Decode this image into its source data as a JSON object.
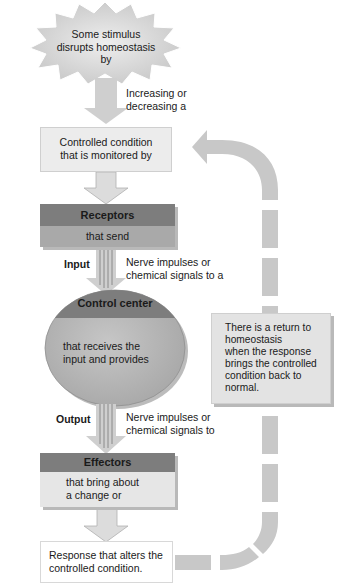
{
  "diagram": {
    "stimulus": {
      "text": "Some stimulus disrupts homeostasis by",
      "line1": "Some stimulus",
      "line2": "disrupts homeostasis by"
    },
    "stimulus_arrow_label": {
      "line1": "Increasing or",
      "line2": "decreasing a"
    },
    "controlled_condition": {
      "line1": "Controlled condition",
      "line2": "that is monitored by"
    },
    "receptors": {
      "title": "Receptors",
      "body": "that send"
    },
    "input": {
      "label": "Input",
      "line1": "Nerve impulses or",
      "line2": "chemical signals to a"
    },
    "control_center": {
      "title": "Control center",
      "line1": "that receives the",
      "line2": "input and provides"
    },
    "output": {
      "label": "Output",
      "line1": "Nerve impulses or",
      "line2": "chemical signals to"
    },
    "effectors": {
      "title": "Effectors",
      "line1": "that bring about",
      "line2": "a change or"
    },
    "response": {
      "line1": "Response that alters the",
      "line2": "controlled condition."
    },
    "return_note": {
      "lines": [
        "There is a return to",
        "homeostasis",
        "when the response",
        "brings the controlled",
        "condition back to",
        "normal."
      ]
    },
    "colors": {
      "header_dark": "#7d7d7d",
      "body_mid": "#a9a9a9",
      "box_light": "#ececec",
      "arrow_fill": "#cfcfcf",
      "dashed_path": "#c8c8c8",
      "ellipse_fill": "#b8b8b8",
      "starburst_fill": "#d6d6d6"
    }
  }
}
